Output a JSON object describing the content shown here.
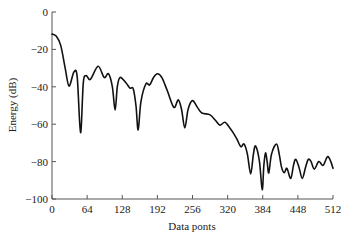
{
  "chart_data": {
    "type": "line",
    "title": "",
    "xlabel": "Data ponts",
    "ylabel": "Energy (dB)",
    "xlim": [
      0,
      512
    ],
    "ylim": [
      -100,
      0
    ],
    "grid": false,
    "legend": null,
    "xticks": [
      0,
      64,
      128,
      192,
      256,
      320,
      384,
      448,
      512
    ],
    "xtick_labels": [
      "0",
      "64",
      "128",
      "192",
      "256",
      "320",
      "384",
      "448",
      "512"
    ],
    "yticks": [
      0,
      -20,
      -40,
      -60,
      -80,
      -100
    ],
    "ytick_labels": [
      "0",
      "−20",
      "−40",
      "−60",
      "−80",
      "−100"
    ],
    "series": [
      {
        "name": "Energy",
        "color": "#111111",
        "x": [
          0,
          8,
          16,
          24,
          31,
          40,
          46,
          52,
          57,
          62,
          70,
          84,
          95,
          103,
          110,
          115,
          119,
          124,
          135,
          142,
          148,
          153,
          157,
          162,
          171,
          178,
          185,
          192,
          200,
          210,
          222,
          230,
          236,
          242,
          248,
          256,
          265,
          273,
          288,
          298,
          306,
          315,
          324,
          330,
          337,
          344,
          350,
          356,
          362,
          367,
          371,
          378,
          383,
          386,
          389,
          392,
          395,
          400,
          409,
          414,
          418,
          423,
          428,
          435,
          440,
          444,
          450,
          456,
          462,
          467,
          472,
          478,
          486,
          494,
          502,
          508,
          512
        ],
        "y": [
          -11.8,
          -13,
          -18,
          -30,
          -39.6,
          -32,
          -35,
          -64.5,
          -38,
          -34,
          -36,
          -29,
          -35,
          -33,
          -40,
          -52.5,
          -40,
          -35,
          -38,
          -40.7,
          -41,
          -50,
          -63,
          -48,
          -38.5,
          -39,
          -35,
          -33,
          -35,
          -42,
          -51,
          -47,
          -52,
          -62,
          -52,
          -47.4,
          -51,
          -54,
          -55,
          -58,
          -60.5,
          -59,
          -62,
          -64.5,
          -68,
          -72,
          -70.6,
          -76,
          -86.6,
          -76,
          -71.7,
          -80,
          -95,
          -82,
          -75.4,
          -80,
          -86,
          -76,
          -70.6,
          -76,
          -82.7,
          -86,
          -83.6,
          -89,
          -82,
          -78.8,
          -83,
          -89,
          -83,
          -78.8,
          -80,
          -84,
          -80,
          -82,
          -77.4,
          -80,
          -83.6
        ]
      }
    ]
  }
}
